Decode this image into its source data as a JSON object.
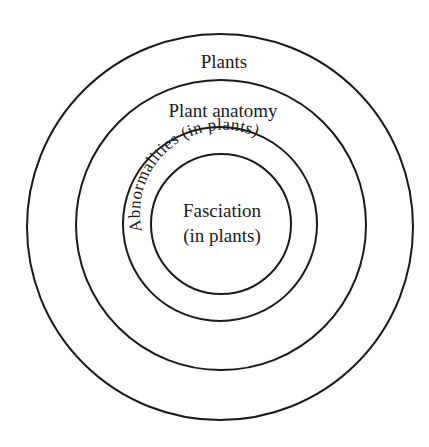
{
  "diagram": {
    "type": "nested-circles",
    "center": [
      220,
      224
    ],
    "rings": [
      {
        "name": "Plants",
        "radius": 193,
        "label": "Plants",
        "label_pos": [
          220,
          68
        ]
      },
      {
        "name": "Plant anatomy",
        "radius": 145,
        "label": "Plant anatomy",
        "label_pos": [
          221,
          117
        ]
      },
      {
        "name": "Abnormalities (in plants)",
        "radius": 97,
        "label": "Abnormalities (in plants)"
      },
      {
        "name": "Fasciation (in plants)",
        "radius": 70,
        "label_line1": "Fasciation",
        "label_line2": "(in plants)"
      }
    ],
    "stroke_color": "#1a1a1a",
    "background": "#ffffff"
  }
}
